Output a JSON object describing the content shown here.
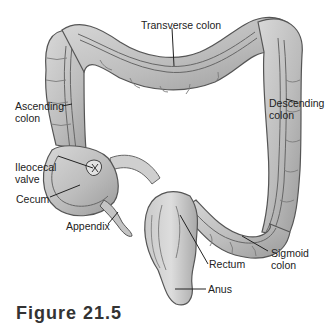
{
  "figure": {
    "caption": "Figure 21.5",
    "colors": {
      "tissue_fill": "#b9b9b9",
      "tissue_light": "#d6d6d6",
      "tissue_dark": "#8c8c8c",
      "outline": "#555555",
      "leader_line": "#222222",
      "text": "#222222",
      "background": "#ffffff"
    },
    "labels": {
      "transverse_colon": "Transverse colon",
      "ascending_colon": "Ascending\ncolon",
      "descending_colon": "Descending\ncolon",
      "ileocecal_valve": "Ileocecal\nvalve",
      "cecum": "Cecum",
      "appendix": "Appendix",
      "sigmoid_colon": "Sigmoid\ncolon",
      "rectum": "Rectum",
      "anus": "Anus"
    }
  }
}
